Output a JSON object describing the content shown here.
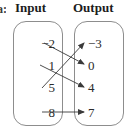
{
  "figure": {
    "type": "mapping-diagram",
    "headers": {
      "prefix": "a:",
      "input": "Input",
      "output": "Output"
    },
    "input_values": [
      "−2",
      "1",
      "5",
      "8"
    ],
    "output_values": [
      "−3",
      "0",
      "4",
      "7"
    ],
    "mappings": [
      {
        "from": "−2",
        "to": "0"
      },
      {
        "from": "1",
        "to": "4"
      },
      {
        "from": "5",
        "to": "−3"
      },
      {
        "from": "8",
        "to": "7"
      }
    ],
    "colors": {
      "oval_border": "#8d8d8d",
      "arrow": "#3a3a3a",
      "text": "#2b2b2b",
      "background": "#ffffff"
    }
  }
}
